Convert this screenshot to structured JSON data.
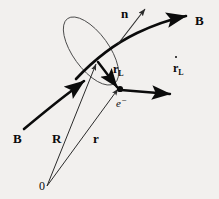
{
  "figure": {
    "background_color": "#f2f0ee",
    "ink_color": "#0b0b0b",
    "thin_stroke_color": "#3a3a3a",
    "labels": {
      "b_field_top": "B",
      "b_field_bottom": "B",
      "normal": "n",
      "larmor_radius": "r",
      "larmor_radius_sub": "L",
      "larmor_velocity": "r",
      "larmor_velocity_sub": "L",
      "guiding_center": "R",
      "position": "r",
      "origin": "0",
      "electron": "e",
      "electron_charge": "−"
    },
    "elements": [
      {
        "name": "magnetic-field-line-upper",
        "kind": "curved-arrow",
        "label": "B"
      },
      {
        "name": "magnetic-field-line-lower",
        "kind": "curve",
        "label": "B"
      },
      {
        "name": "normal-vector",
        "kind": "thin-arrow",
        "label": "n"
      },
      {
        "name": "gyro-orbit-ellipse",
        "kind": "ellipse",
        "label": ""
      },
      {
        "name": "larmor-radius-vector",
        "kind": "thick-arrow",
        "label": "r_L"
      },
      {
        "name": "larmor-velocity-vector",
        "kind": "thick-arrow",
        "label": "r-dot_L"
      },
      {
        "name": "guiding-center-vector",
        "kind": "thin-arrow",
        "label": "R"
      },
      {
        "name": "position-vector",
        "kind": "thin-arrow",
        "label": "r"
      },
      {
        "name": "electron-point",
        "kind": "dot",
        "label": "e-"
      },
      {
        "name": "origin-point",
        "kind": "vertex",
        "label": "0"
      }
    ]
  }
}
